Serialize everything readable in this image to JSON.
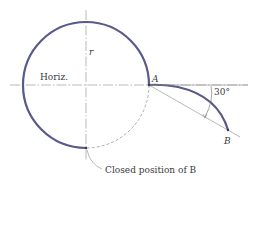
{
  "figure": {
    "labels": {
      "horizontal": "Horiz.",
      "radius": "r",
      "point_a": "A",
      "angle": "30°",
      "point_b": "B",
      "closed_position": "Closed position of B"
    },
    "colors": {
      "curve": "#5a5a8a",
      "centerline": "#8a8a8a",
      "text": "#3a3a3a"
    },
    "geometry": {
      "circle_center": [
        86,
        85
      ],
      "circle_radius": 63,
      "point_a": [
        149,
        85
      ],
      "point_b": [
        228,
        130
      ],
      "chord_angle_deg": 30
    }
  }
}
